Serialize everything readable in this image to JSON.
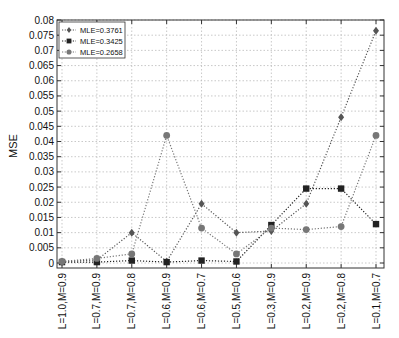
{
  "chart_data": {
    "type": "line",
    "title": "",
    "xlabel": "",
    "ylabel": "MSE",
    "ylim": [
      0,
      0.08
    ],
    "yticks": [
      "0",
      "0.005",
      "0.01",
      "0.015",
      "0.02",
      "0.025",
      "0.03",
      "0.035",
      "0.04",
      "0.045",
      "0.05",
      "0.055",
      "0.06",
      "0.065",
      "0.07",
      "0.075",
      "0.08"
    ],
    "categories": [
      "L=1.0,M=0.9",
      "L=0.7,M=0.9",
      "L=0.7,M=0.8",
      "L=0.6,M=0.9",
      "L=0.6,M=0.7",
      "L=0.5,M=0.6",
      "L=0.3,M=0.9",
      "L=0.2,M=0.9",
      "L=0.2,M=0.8",
      "L=0.1,M=0.7"
    ],
    "grid": true,
    "legend_position": "upper left",
    "series": [
      {
        "name": "MLE=0.3761",
        "marker": "diamond",
        "color": "#555555",
        "values": [
          0.0005,
          0.001,
          0.01,
          0.0005,
          0.0195,
          0.01,
          0.0105,
          0.0195,
          0.048,
          0.0765
        ]
      },
      {
        "name": "MLE=0.3425",
        "marker": "square",
        "color": "#222222",
        "values": [
          0.0003,
          0.0003,
          0.0008,
          0.0003,
          0.0008,
          0.0005,
          0.0125,
          0.0245,
          0.0245,
          0.0128
        ]
      },
      {
        "name": "MLE=0.2658",
        "marker": "circle",
        "color": "#777777",
        "values": [
          0.0005,
          0.0015,
          0.003,
          0.042,
          0.0115,
          0.003,
          0.0115,
          0.011,
          0.012,
          0.042
        ]
      }
    ]
  }
}
